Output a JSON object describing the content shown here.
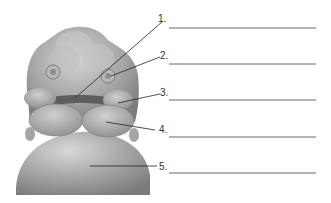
{
  "diagram": {
    "colors": {
      "tissue_base": "#9a9a9a",
      "tissue_light": "#cfcfcf",
      "tissue_dark": "#6e6e6e",
      "leader_line": "#222222",
      "blank_line": "#555555"
    },
    "labels": [
      {
        "number": "1.",
        "answer": ""
      },
      {
        "number": "2.",
        "answer": ""
      },
      {
        "number": "3.",
        "answer": ""
      },
      {
        "number": "4.",
        "answer": ""
      },
      {
        "number": "5.",
        "answer": ""
      }
    ]
  }
}
